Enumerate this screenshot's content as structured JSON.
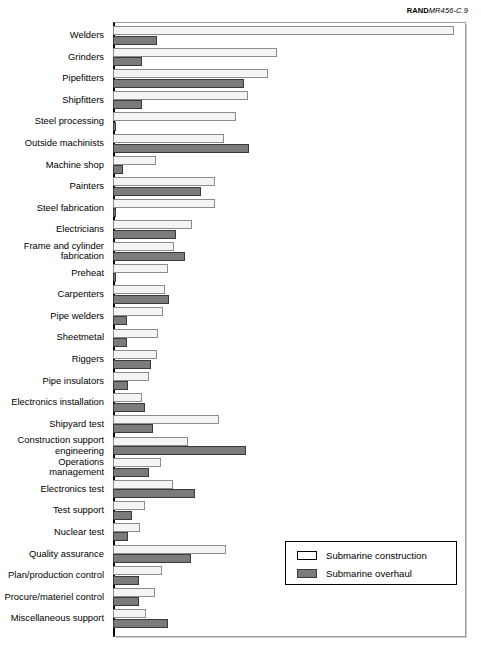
{
  "source_credit": {
    "bold_prefix": "RAND",
    "rest": "MR456-C.9"
  },
  "legend": {
    "position": "bottom-right",
    "items": [
      {
        "label": "Submarine construction",
        "swatch": "construction",
        "color": "#ffffff"
      },
      {
        "label": "Submarine overhaul",
        "swatch": "overhaul",
        "color": "#7b7b7b"
      }
    ]
  },
  "colors": {
    "construction": "#f4f4f4",
    "construction_border": "#8c8c8c",
    "overhaul": "#7b7b7b",
    "overhaul_border": "#3a3a3a",
    "axis": "#000000",
    "frame": "#9a9a9a"
  },
  "chart_data": {
    "type": "bar",
    "orientation": "horizontal",
    "title": "",
    "subtitle": "",
    "xlabel": "",
    "ylabel": "",
    "grid": false,
    "axis_min": 0,
    "axis_max": 100,
    "note": "Values are relative percentages of the longest bar (Welders, submarine construction = 100). No numeric axis ticks are printed on the figure.",
    "categories": [
      "Welders",
      "Grinders",
      "Pipefitters",
      "Shipfitters",
      "Steel processing",
      "Outside machinists",
      "Machine shop",
      "Painters",
      "Steel fabrication",
      "Electricians",
      "Frame and cylinder\nfabrication",
      "Preheat",
      "Carpenters",
      "Pipe welders",
      "Sheetmetal",
      "Riggers",
      "Pipe insulators",
      "Electronics installation",
      "Shipyard test",
      "Construction support\nengineering",
      "Operations\nmanagement",
      "Electronics test",
      "Test support",
      "Nuclear test",
      "Quality assurance",
      "Plan/production control",
      "Procure/materiel control",
      "Miscellaneous support"
    ],
    "series": [
      {
        "name": "Submarine construction",
        "color": "#f4f4f4",
        "values": [
          100.0,
          48.0,
          45.5,
          39.5,
          36.0,
          32.5,
          12.5,
          29.8,
          30.0,
          23.3,
          18.0,
          16.0,
          15.2,
          14.8,
          13.3,
          13.0,
          10.5,
          8.5,
          31.0,
          22.0,
          14.0,
          17.5,
          9.5,
          8.0,
          33.0,
          14.5,
          12.3,
          9.8
        ]
      },
      {
        "name": "Submarine overhaul",
        "color": "#7b7b7b",
        "values": [
          13.0,
          8.5,
          38.5,
          8.5,
          0.6,
          39.8,
          3.0,
          25.8,
          0.6,
          18.5,
          21.0,
          0.6,
          16.5,
          4.2,
          4.0,
          11.0,
          4.5,
          9.5,
          11.8,
          39.0,
          10.5,
          24.0,
          5.5,
          4.5,
          23.0,
          7.5,
          7.5,
          16.0
        ]
      }
    ]
  },
  "layout": {
    "plot_left_px": 113,
    "plot_top_px": 22,
    "plot_width_px": 353,
    "plot_height_px": 615
  }
}
